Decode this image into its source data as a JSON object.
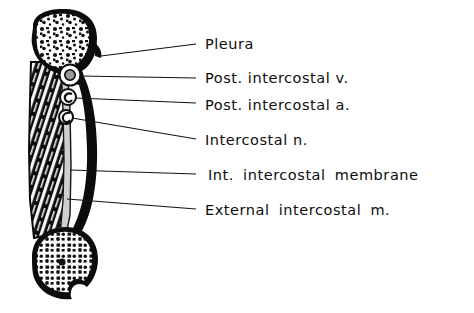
{
  "figure": {
    "background_color": "#ffffff",
    "ink_color": "#111111",
    "width": 474,
    "height": 313
  },
  "labels": [
    {
      "id": "pleura",
      "text": "Pleura",
      "x": 205,
      "y": 44,
      "wide": false
    },
    {
      "id": "post-intercostal-v",
      "text": "Post. intercostal v.",
      "x": 205,
      "y": 78,
      "wide": false
    },
    {
      "id": "post-intercostal-a",
      "text": "Post. intercostal a.",
      "x": 205,
      "y": 105,
      "wide": false
    },
    {
      "id": "intercostal-n",
      "text": "Intercostal n.",
      "x": 205,
      "y": 140,
      "wide": false
    },
    {
      "id": "int-intercostal-membrane",
      "text": "Int. intercostal membrane",
      "x": 208,
      "y": 175,
      "wide": true
    },
    {
      "id": "external-intercostal-m",
      "text": "External intercostal m.",
      "x": 205,
      "y": 210,
      "wide": true
    }
  ],
  "leader_lines": [
    {
      "id": "leader-pleura",
      "x1": 101,
      "y1": 56,
      "x2": 196,
      "y2": 44
    },
    {
      "id": "leader-post-intercostal-v",
      "x1": 79,
      "y1": 76,
      "x2": 196,
      "y2": 78
    },
    {
      "id": "leader-post-intercostal-a",
      "x1": 76,
      "y1": 98,
      "x2": 196,
      "y2": 103
    },
    {
      "id": "leader-intercostal-n",
      "x1": 72,
      "y1": 118,
      "x2": 196,
      "y2": 139
    },
    {
      "id": "leader-int-membrane",
      "x1": 70,
      "y1": 170,
      "x2": 196,
      "y2": 174
    },
    {
      "id": "leader-external-m",
      "x1": 67,
      "y1": 199,
      "x2": 196,
      "y2": 209
    }
  ],
  "structures": [
    {
      "id": "upper-rib",
      "name": "Upper rib cross-section",
      "description": "Oval rib with thick black cortical bone and speckled trabecular marrow"
    },
    {
      "id": "lower-rib",
      "name": "Lower rib cross-section",
      "description": "Rounded rib with notch at inferior border"
    },
    {
      "id": "intercostal-muscle",
      "name": "External intercostal muscle",
      "description": "Dark striated muscle mass filling the intercostal space"
    },
    {
      "id": "internal-membrane",
      "name": "Internal intercostal membrane",
      "description": "Pale vertical strip medial to the muscle"
    },
    {
      "id": "vein",
      "name": "Posterior intercostal vein",
      "description": "Largest vessel in the costal groove"
    },
    {
      "id": "artery",
      "name": "Posterior intercostal artery",
      "description": "Middle vessel in the costal groove"
    },
    {
      "id": "nerve",
      "name": "Intercostal nerve",
      "description": "Smallest structure, inferior in the costal groove"
    }
  ]
}
